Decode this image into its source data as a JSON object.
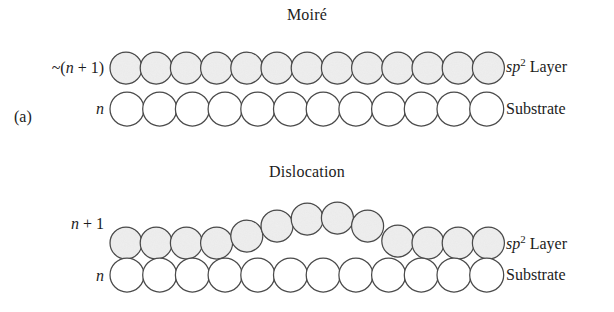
{
  "figure": {
    "panels": [
      {
        "id": "a",
        "panel_label": "(a)",
        "title": "Moiré",
        "top_row": {
          "left_label_prefix": "~(",
          "left_label_var": "n",
          "left_label_suffix": " + 1)",
          "left_label_text": "~(n + 1)",
          "right_label_var": "sp",
          "right_label_sup": "2",
          "right_label_suffix": " Layer",
          "right_label_text": "sp2 Layer",
          "count": 13,
          "fill": "#dedede",
          "stroke": "#4a4a4a"
        },
        "bottom_row": {
          "left_label_var": "n",
          "left_label_text": "n",
          "right_label_text": "Substrate",
          "count": 12,
          "fill": "#ffffff",
          "stroke": "#4a4a4a"
        }
      },
      {
        "id": "b",
        "panel_label": "(b)",
        "title": "Dislocation",
        "top_row": {
          "left_label_var": "n",
          "left_label_suffix": " + 1",
          "left_label_text": "n + 1",
          "right_label_var": "sp",
          "right_label_sup": "2",
          "right_label_suffix": " Layer",
          "right_label_text": "sp2 Layer",
          "count": 13,
          "fill": "#dedede",
          "stroke": "#4a4a4a"
        },
        "bottom_row": {
          "left_label_var": "n",
          "left_label_text": "n",
          "right_label_text": "Substrate",
          "count": 12,
          "fill": "#ffffff",
          "stroke": "#4a4a4a"
        }
      }
    ]
  },
  "chart_data": {
    "type": "diagram",
    "subtitle": "",
    "xlabel": "",
    "ylabel": "",
    "panels": [
      {
        "label": "(a)",
        "title": "Moiré",
        "series": [
          {
            "name": "sp2 Layer",
            "row_label": "~(n + 1)",
            "atom_count": 13,
            "shaded": true,
            "geometry": "flat",
            "radius": 16,
            "pitch": 30.2,
            "x_start": 126,
            "y_center": 68,
            "y_offsets": [
              0,
              0,
              0,
              0,
              0,
              0,
              0,
              0,
              0,
              0,
              0,
              0,
              0
            ]
          },
          {
            "name": "Substrate",
            "row_label": "n",
            "atom_count": 12,
            "shaded": false,
            "geometry": "flat",
            "radius": 17,
            "pitch": 32.7,
            "x_start": 127,
            "y_center": 109,
            "y_offsets": [
              0,
              0,
              0,
              0,
              0,
              0,
              0,
              0,
              0,
              0,
              0,
              0
            ]
          }
        ]
      },
      {
        "label": "(b)",
        "title": "Dislocation",
        "series": [
          {
            "name": "sp2 Layer",
            "row_label": "n + 1",
            "atom_count": 13,
            "shaded": true,
            "geometry": "arched",
            "radius": 16,
            "pitch": 30.2,
            "x_start": 126,
            "y_center": 243,
            "y_offsets": [
              0,
              0,
              0,
              0,
              -7,
              -17,
              -24,
              -25,
              -17,
              -2,
              0,
              0,
              0
            ]
          },
          {
            "name": "Substrate",
            "row_label": "n",
            "atom_count": 12,
            "shaded": false,
            "geometry": "flat",
            "radius": 17,
            "pitch": 32.7,
            "x_start": 127,
            "y_center": 275,
            "y_offsets": [
              0,
              0,
              0,
              0,
              0,
              0,
              0,
              0,
              0,
              0,
              0,
              0
            ]
          }
        ]
      }
    ],
    "annotations": [
      "Panel (a): ~(n + 1) sp2 atoms commensurate with n substrate atoms produce a moiré pattern.",
      "Panel (b): n + 1 sp2 atoms over n substrate atoms relieve strain by forming a dislocation buckle."
    ],
    "legend": [],
    "grid": false
  }
}
